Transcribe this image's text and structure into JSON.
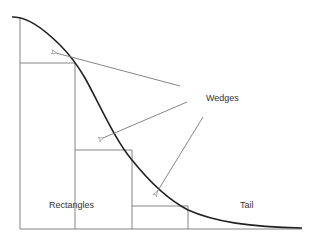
{
  "diagram": {
    "type": "ziggurat-approximation",
    "labels": {
      "wedges": "Wedges",
      "rectangles": "Rectangles",
      "tail": "Tail"
    },
    "colors": {
      "curve": "#222222",
      "grid": "#777777",
      "text": "#333333"
    }
  }
}
